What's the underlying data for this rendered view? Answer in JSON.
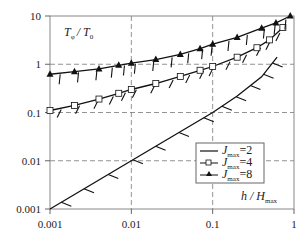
{
  "chart_data": {
    "type": "line",
    "title": "",
    "xlabel": "h / H_max",
    "ylabel": "T_phi / T_0",
    "xscale": "log",
    "yscale": "log",
    "xlim": [
      0.001,
      1
    ],
    "ylim": [
      0.001,
      10
    ],
    "x_ticks": [
      "0.001",
      "0.01",
      "0.1",
      "1"
    ],
    "y_ticks": [
      "0.001",
      "0.01",
      "0.1",
      "1",
      "10"
    ],
    "grid": "dashed at decades",
    "legend_position": "lower right (inside)",
    "series": [
      {
        "name": "J_max=2",
        "marker": "none",
        "x": [
          0.001,
          0.003,
          0.01,
          0.03,
          0.1,
          0.2,
          0.4,
          0.62
        ],
        "y": [
          0.001,
          0.003,
          0.01,
          0.03,
          0.1,
          0.22,
          0.55,
          1.4
        ]
      },
      {
        "name": "J_max=4",
        "marker": "open-square",
        "x": [
          0.001,
          0.002,
          0.004,
          0.007,
          0.01,
          0.02,
          0.04,
          0.07,
          0.1,
          0.2,
          0.35,
          0.5,
          0.73
        ],
        "y": [
          0.11,
          0.14,
          0.19,
          0.25,
          0.3,
          0.4,
          0.56,
          0.75,
          0.9,
          1.4,
          2.2,
          3.2,
          5.8
        ]
      },
      {
        "name": "J_max=8",
        "marker": "filled-triangle",
        "x": [
          0.001,
          0.002,
          0.004,
          0.007,
          0.01,
          0.02,
          0.04,
          0.07,
          0.1,
          0.2,
          0.4,
          0.6,
          0.9
        ],
        "y": [
          0.62,
          0.7,
          0.8,
          0.95,
          1.05,
          1.25,
          1.6,
          2.1,
          2.6,
          3.6,
          5.6,
          7.2,
          10
        ]
      }
    ]
  },
  "labels": {
    "y_axis": "T",
    "y_axis_sub": "φ",
    "y_axis_den": "/ T",
    "y_axis_den_sub": "0",
    "x_axis": "h / H",
    "x_axis_sub": "max",
    "legend": [
      {
        "main": "J",
        "sub": "max",
        "val": "=2"
      },
      {
        "main": "J",
        "sub": "max",
        "val": "=4"
      },
      {
        "main": "J",
        "sub": "max",
        "val": "=8"
      }
    ]
  }
}
